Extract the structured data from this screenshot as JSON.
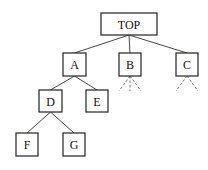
{
  "diagram": {
    "type": "tree",
    "nodes": [
      {
        "id": "TOP",
        "label": "TOP",
        "x": 101,
        "y": 13,
        "w": 56,
        "h": 22
      },
      {
        "id": "A",
        "label": "A",
        "x": 63,
        "y": 53,
        "w": 23,
        "h": 23
      },
      {
        "id": "B",
        "label": "B",
        "x": 119,
        "y": 53,
        "w": 22,
        "h": 23
      },
      {
        "id": "C",
        "label": "C",
        "x": 176,
        "y": 53,
        "w": 22,
        "h": 23
      },
      {
        "id": "D",
        "label": "D",
        "x": 39,
        "y": 90,
        "w": 23,
        "h": 22
      },
      {
        "id": "E",
        "label": "E",
        "x": 86,
        "y": 90,
        "w": 22,
        "h": 22
      },
      {
        "id": "F",
        "label": "F",
        "x": 16,
        "y": 133,
        "w": 22,
        "h": 23
      },
      {
        "id": "G",
        "label": "G",
        "x": 63,
        "y": 133,
        "w": 22,
        "h": 23
      }
    ],
    "edges": [
      {
        "from": "TOP",
        "to": "A"
      },
      {
        "from": "TOP",
        "to": "B"
      },
      {
        "from": "TOP",
        "to": "C"
      },
      {
        "from": "A",
        "to": "D"
      },
      {
        "from": "A",
        "to": "E"
      },
      {
        "from": "D",
        "to": "F"
      },
      {
        "from": "D",
        "to": "G"
      }
    ],
    "dashed_continuations": [
      {
        "node": "B",
        "count": 3
      },
      {
        "node": "C",
        "count": 2
      }
    ]
  }
}
